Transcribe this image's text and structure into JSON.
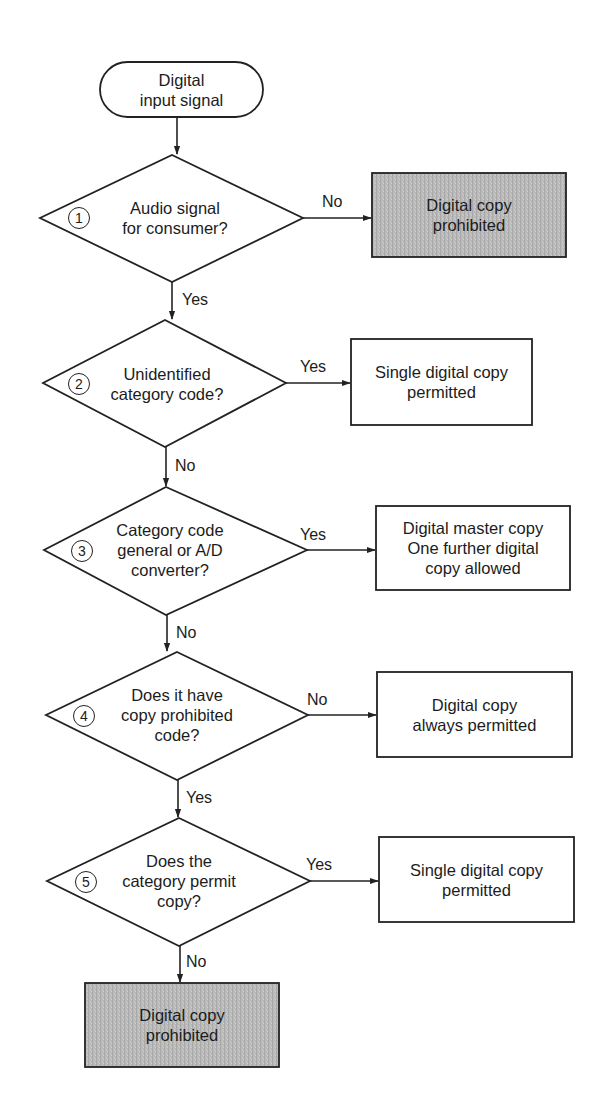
{
  "diagram": {
    "type": "flowchart",
    "colors": {
      "line": "#222222",
      "background": "#ffffff",
      "prohibited_fill": "#b8b8b8",
      "box_fill": "#ffffff"
    },
    "start": {
      "lines": [
        "Digital",
        "input signal"
      ]
    },
    "decisions": [
      {
        "step": "1",
        "lines": [
          "Audio signal",
          "for consumer?"
        ],
        "down_label": "Yes",
        "right_label": "No",
        "outcome": {
          "lines": [
            "Digital copy",
            "prohibited"
          ],
          "style": "prohibited"
        }
      },
      {
        "step": "2",
        "lines": [
          "Unidentified",
          "category code?"
        ],
        "down_label": "No",
        "right_label": "Yes",
        "outcome": {
          "lines": [
            "Single digital copy",
            "permitted"
          ],
          "style": "normal"
        }
      },
      {
        "step": "3",
        "lines": [
          "Category code",
          "general or A/D",
          "converter?"
        ],
        "down_label": "No",
        "right_label": "Yes",
        "outcome": {
          "lines": [
            "Digital master copy",
            "One further digital",
            "copy allowed"
          ],
          "style": "normal"
        }
      },
      {
        "step": "4",
        "lines": [
          "Does it have",
          "copy prohibited",
          "code?"
        ],
        "down_label": "Yes",
        "right_label": "No",
        "outcome": {
          "lines": [
            "Digital copy",
            "always permitted"
          ],
          "style": "normal"
        }
      },
      {
        "step": "5",
        "lines": [
          "Does the",
          "category permit",
          "copy?"
        ],
        "down_label": "No",
        "right_label": "Yes",
        "outcome": {
          "lines": [
            "Single digital copy",
            "permitted"
          ],
          "style": "normal"
        }
      }
    ],
    "end": {
      "lines": [
        "Digital copy",
        "prohibited"
      ],
      "style": "prohibited"
    }
  }
}
